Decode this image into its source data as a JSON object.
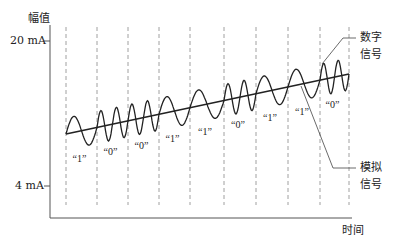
{
  "axes": {
    "y_label": "幅值",
    "x_label": "时间",
    "y_ticks": [
      {
        "label": "20 mA",
        "value": 20
      },
      {
        "label": "4 mA",
        "value": 4
      }
    ]
  },
  "annotations": {
    "digital_signal": [
      "数字",
      "信号"
    ],
    "analog_signal": [
      "模拟",
      "信号"
    ]
  },
  "bits": [
    "“1”",
    "“0”",
    "“0”",
    "“1”",
    "“1”",
    "“0”",
    "“1”",
    "“1”",
    "“0”"
  ],
  "bit_values": [
    1,
    0,
    0,
    1,
    1,
    0,
    1,
    1,
    0
  ],
  "colors": {
    "line": "#222222",
    "dash": "#888888",
    "axis": "#555555"
  },
  "chart_data": {
    "type": "line",
    "title": "",
    "xlabel": "时间",
    "ylabel": "幅值",
    "ylim": [
      4,
      20
    ],
    "y_ticks": [
      "4 mA",
      "20 mA"
    ],
    "series": [
      {
        "name": "模拟信号",
        "description": "rising linear 4-20 mA analog current baseline"
      },
      {
        "name": "数字信号",
        "description": "FSK sine superimposed on analog: '1' = 1 cycle per bit, '0' = 2 cycles per bit",
        "bits": [
          1,
          0,
          0,
          1,
          1,
          0,
          1,
          1,
          0
        ]
      }
    ],
    "grid": "vertical dashed lines at bit boundaries"
  }
}
